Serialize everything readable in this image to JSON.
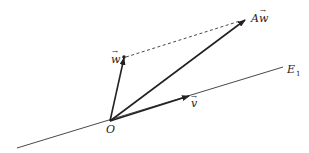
{
  "diagram": {
    "type": "vector-diagram",
    "colors": {
      "stroke": "#222222",
      "line": "#333333",
      "background": "#ffffff"
    },
    "origin": {
      "label": "O",
      "x": 110,
      "y": 121
    },
    "line_E1": {
      "label": "E",
      "subscript": "1",
      "x1": 17,
      "y1": 148,
      "x2": 283,
      "y2": 67
    },
    "vectors": [
      {
        "id": "w",
        "label": "w",
        "has_arrow_accent": true,
        "x2": 124,
        "y2": 57,
        "style": "solid-arrow"
      },
      {
        "id": "Aw",
        "label": "Aw",
        "has_arrow_accent": true,
        "x2": 247,
        "y2": 19,
        "style": "solid-arrow"
      },
      {
        "id": "v",
        "label": "v",
        "has_arrow_accent": true,
        "x2": 190,
        "y2": 96,
        "style": "solid-arrow"
      }
    ],
    "dashed_connector": {
      "from": "w",
      "to": "Aw",
      "x1": 124,
      "y1": 57,
      "x2": 247,
      "y2": 19
    },
    "labels": {
      "w": "w",
      "Aw_A": "A",
      "Aw_w": "w",
      "v": "v",
      "O": "O",
      "E": "E",
      "E_sub": "1",
      "vec_accent": "→"
    }
  }
}
